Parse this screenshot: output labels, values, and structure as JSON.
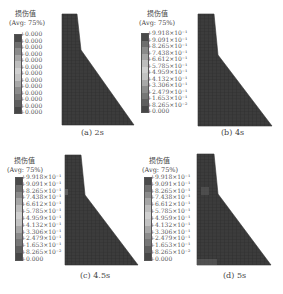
{
  "figure": {
    "legend_title": "损伤值",
    "legend_avg": "(Avg: 75%)",
    "band_colors": [
      "#4a4a4a",
      "#6e6e6e",
      "#8a8a8a",
      "#a5a5a5",
      "#bdbdbd",
      "#cfcfcf",
      "#c2c2c2",
      "#a8a8a8",
      "#8c8c8c",
      "#767676",
      "#5e5e5e",
      "#474747"
    ],
    "dam_color": "#3a3a3a",
    "mesh_color": "#2a2a2a"
  },
  "panels": [
    {
      "id": "a",
      "caption": "(a) 2s",
      "labels": [
        "+0.000",
        "+0.000",
        "+0.000",
        "+0.000",
        "+0.000",
        "+0.000",
        "+0.000",
        "+0.000",
        "+0.000",
        "+0.000",
        "+0.000",
        "+0.000",
        "+0.000"
      ]
    },
    {
      "id": "b",
      "caption": "(b) 4s",
      "labels": [
        "+9.918×10⁻¹",
        "+9.091×10⁻¹",
        "+8.265×10⁻¹",
        "+7.438×10⁻¹",
        "+6.612×10⁻¹",
        "+5.785×10⁻¹",
        "+4.959×10⁻¹",
        "+4.132×10⁻¹",
        "+3.306×10⁻¹",
        "+2.479×10⁻¹",
        "+1.653×10⁻¹",
        "+8.265×10⁻²",
        "+0.000"
      ]
    },
    {
      "id": "c",
      "caption": "(c) 4.5s",
      "labels": [
        "+9.918×10⁻¹",
        "+9.091×10⁻¹",
        "+8.265×10⁻¹",
        "+7.438×10⁻¹",
        "+6.612×10⁻¹",
        "+5.785×10⁻¹",
        "+4.959×10⁻¹",
        "+4.132×10⁻¹",
        "+3.306×10⁻¹",
        "+2.479×10⁻¹",
        "+1.653×10⁻¹",
        "+8.265×10⁻²",
        "+0.000"
      ]
    },
    {
      "id": "d",
      "caption": "(d) 5s",
      "labels": [
        "+9.918×10⁻¹",
        "+9.091×10⁻¹",
        "+8.265×10⁻¹",
        "+7.438×10⁻¹",
        "+6.612×10⁻¹",
        "+5.785×10⁻¹",
        "+4.959×10⁻¹",
        "+4.132×10⁻¹",
        "+3.306×10⁻¹",
        "+2.479×10⁻¹",
        "+1.653×10⁻¹",
        "+8.265×10⁻²",
        "+0.000"
      ]
    }
  ]
}
